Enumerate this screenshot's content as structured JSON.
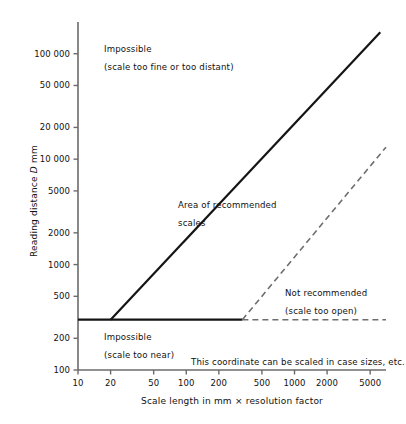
{
  "chart_data": {
    "type": "line",
    "title": "",
    "xlabel": "Scale length in mm × resolution factor",
    "ylabel": "Reading distance D mm",
    "xscale": "log",
    "yscale": "log",
    "xlim": [
      10,
      7000
    ],
    "ylim": [
      100,
      200000
    ],
    "grid": false,
    "legend": "none",
    "xticks": [
      10,
      20,
      50,
      100,
      200,
      500,
      1000,
      2000,
      5000
    ],
    "xtick_labels": [
      "10",
      "20",
      "50",
      "100",
      "200",
      "500",
      "1000",
      "2000",
      "5000"
    ],
    "yticks": [
      100,
      200,
      500,
      1000,
      2000,
      5000,
      10000,
      20000,
      50000,
      100000
    ],
    "ytick_labels": [
      "100",
      "200",
      "500",
      "1000",
      "2000",
      "5000",
      "10 000",
      "20 000",
      "50 000",
      "100 000"
    ],
    "series": [
      {
        "name": "upper-limit-boundary",
        "style": "solid",
        "color": "#141414",
        "width": 2.2,
        "points": [
          [
            20,
            300
          ],
          [
            6200,
            160000
          ]
        ]
      },
      {
        "name": "minimum-reading-distance",
        "style": "solid",
        "color": "#141414",
        "width": 2.2,
        "points": [
          [
            10,
            300
          ],
          [
            330,
            300
          ]
        ]
      },
      {
        "name": "minimum-reading-distance-extension",
        "style": "dashed",
        "color": "#6e6e6e",
        "width": 1.6,
        "points": [
          [
            330,
            300
          ],
          [
            7000,
            300
          ]
        ]
      },
      {
        "name": "lower-limit-boundary",
        "style": "dashed",
        "color": "#6e6e6e",
        "width": 1.6,
        "points": [
          [
            330,
            300
          ],
          [
            7000,
            13000
          ]
        ]
      }
    ],
    "annotations": [
      {
        "name": "impossible-too-fine",
        "line1": "Impossible",
        "line2": "(scale too fine or too distant)",
        "x_px": 104,
        "y_px": 44
      },
      {
        "name": "area-of-recommended-scales",
        "line1": "Area of recommended",
        "line2": "scales",
        "x_px": 178,
        "y_px": 200
      },
      {
        "name": "not-recommended",
        "line1": "Not recommended",
        "line2": "(scale too open)",
        "x_px": 285,
        "y_px": 288
      },
      {
        "name": "impossible-too-near",
        "line1": "Impossible",
        "line2": "(scale too near)",
        "x_px": 104,
        "y_px": 332
      },
      {
        "name": "coordinate-note",
        "line1": "This coordinate can be scaled in case sizes, etc.",
        "line2": "",
        "x_px": 191,
        "y_px": 357
      }
    ]
  },
  "axis": {
    "y_title_prefix": "Reading distance ",
    "y_title_symbol": "D",
    "y_title_suffix": " mm"
  }
}
